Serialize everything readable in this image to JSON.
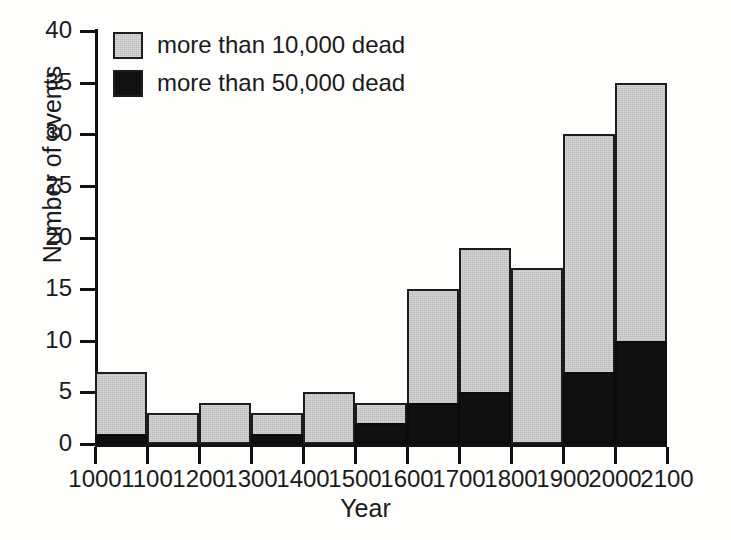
{
  "chart_data": {
    "type": "bar",
    "title": "",
    "xlabel": "Year",
    "ylabel": "Number of events",
    "stacked": true,
    "grid": false,
    "legend_position": "top-left",
    "xlim": [
      1000,
      2100
    ],
    "ylim": [
      0,
      40
    ],
    "ytick_labels": [
      "0",
      "5",
      "10",
      "15",
      "20",
      "25",
      "30",
      "35",
      "40"
    ],
    "ytick_values": [
      0,
      5,
      10,
      15,
      20,
      25,
      30,
      35,
      40
    ],
    "xtick_labels": [
      "1000",
      "1100",
      "1200",
      "1300",
      "1400",
      "1500",
      "1600",
      "1700",
      "1800",
      "1900",
      "2000",
      "2100"
    ],
    "xtick_values": [
      1000,
      1100,
      1200,
      1300,
      1400,
      1500,
      1600,
      1700,
      1800,
      1900,
      2000,
      2100
    ],
    "categories": [
      "1000",
      "1100",
      "1200",
      "1300",
      "1400",
      "1500",
      "1600",
      "1700",
      "1800",
      "1900",
      "2000"
    ],
    "bin_starts": [
      1000,
      1100,
      1200,
      1300,
      1400,
      1500,
      1600,
      1700,
      1800,
      1900,
      2000
    ],
    "bin_ends": [
      1100,
      1200,
      1300,
      1400,
      1500,
      1600,
      1700,
      1800,
      1900,
      2000,
      2100
    ],
    "series": [
      {
        "name": "more than 10,000 dead",
        "color": "#bcbcbc",
        "values": [
          7,
          3,
          4,
          3,
          5,
          4,
          15,
          19,
          17,
          30,
          35
        ]
      },
      {
        "name": "more than 50,000 dead",
        "color": "#111111",
        "values": [
          1,
          0,
          0,
          1,
          0,
          2,
          4,
          5,
          0,
          7,
          10
        ]
      }
    ],
    "legend": [
      {
        "label": "more than 10,000 dead",
        "swatch": "light"
      },
      {
        "label": "more than 50,000 dead",
        "swatch": "dark"
      }
    ]
  },
  "colors": {
    "light_fill": "#bcbcbc",
    "dark_fill": "#111111",
    "outline": "#1d1d1d",
    "background": "#fdfdfc"
  }
}
